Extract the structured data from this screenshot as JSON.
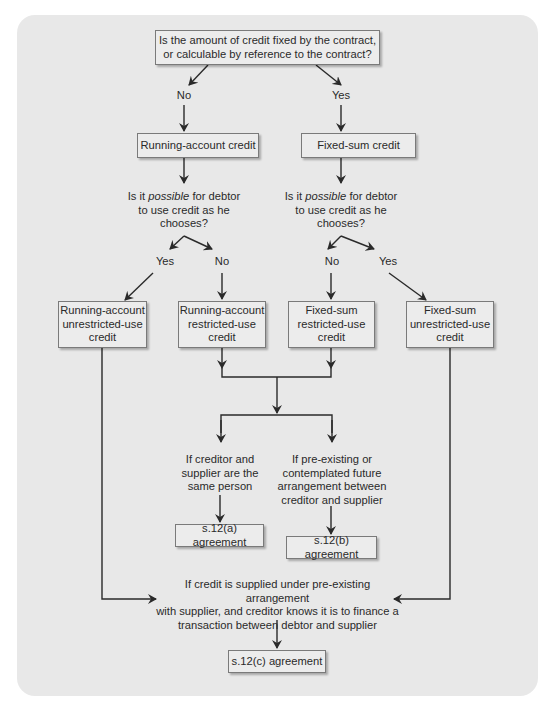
{
  "diagram": {
    "root_question": "Is the amount of credit fixed by the contract,\nor calculable by reference to the contract?",
    "root_no": "No",
    "root_yes": "Yes",
    "running_account": "Running-account credit",
    "fixed_sum": "Fixed-sum credit",
    "question_left": {
      "pre": "Is it ",
      "em": "possible",
      "post": " for debtor\nto use credit as he\nchooses?"
    },
    "question_right": {
      "pre": "Is it ",
      "em": "possible",
      "post": " for debtor\nto use credit as he\nchooses?"
    },
    "left_yes": "Yes",
    "left_no": "No",
    "right_no": "No",
    "right_yes": "Yes",
    "ra_unrestricted": "Running-account\nunrestricted-use\ncredit",
    "ra_restricted": "Running-account\nrestricted-use\ncredit",
    "fs_restricted": "Fixed-sum\nrestricted-use\ncredit",
    "fs_unrestricted": "Fixed-sum\nunrestricted-use\ncredit",
    "cond_same_person": "If creditor and\nsupplier are the\nsame person",
    "cond_arrangement": "If pre-existing or\ncontemplated future\narrangement between\ncreditor and supplier",
    "s12a": "s.12(a) agreement",
    "s12b": "s.12(b) agreement",
    "cond_supplied": "If credit is supplied under pre-existing arrangement\nwith supplier, and creditor knows it is to finance a\ntransaction between debtor and supplier",
    "s12c": "s.12(c) agreement"
  },
  "colors": {
    "panel": "#e8e8e8",
    "box": "#ececec",
    "line": "#2a2a2a",
    "border": "#7a7a7a"
  }
}
